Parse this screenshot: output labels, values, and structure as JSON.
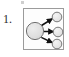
{
  "figure": {
    "number_label": "1.",
    "caption": "",
    "box": {
      "border_color": "#9b9b9b",
      "background_color": "#fdfdfd",
      "x": 23,
      "y": 8,
      "width": 41,
      "height": 42
    },
    "speck": {
      "name": "top-speck",
      "color": "#cfcfcf"
    }
  },
  "diagram": {
    "type": "node-link",
    "colors": {
      "node_fill": "#dcdcdc",
      "node_stroke": "#6f6f6f",
      "small_node_fill": "#e4e4e4",
      "small_node_stroke": "#7a7a7a",
      "arrow_color": "#111111"
    },
    "nodes": [
      {
        "id": "hub",
        "label": "",
        "role": "source",
        "cx": 11,
        "cy": 22,
        "r": 9,
        "fill": "#dcdcdc",
        "stroke": "#6f6f6f"
      },
      {
        "id": "leaf-top",
        "label": "",
        "role": "target",
        "cx": 33,
        "cy": 8,
        "r": 5,
        "fill": "#e4e4e4",
        "stroke": "#7a7a7a"
      },
      {
        "id": "leaf-middle",
        "label": "",
        "role": "target",
        "cx": 34,
        "cy": 23,
        "r": 5,
        "fill": "#e4e4e4",
        "stroke": "#7a7a7a"
      },
      {
        "id": "leaf-bottom",
        "label": "",
        "role": "target",
        "cx": 33,
        "cy": 35,
        "r": 5,
        "fill": "#e4e4e4",
        "stroke": "#7a7a7a"
      }
    ],
    "edges": [
      {
        "id": "edge-top",
        "from": "hub",
        "to": "leaf-top",
        "directed": true
      },
      {
        "id": "edge-middle",
        "from": "hub",
        "to": "leaf-middle",
        "directed": true
      },
      {
        "id": "edge-bottom",
        "from": "hub",
        "to": "leaf-bottom",
        "directed": true
      }
    ]
  }
}
